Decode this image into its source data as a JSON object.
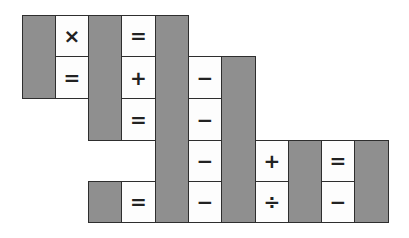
{
  "puzzle": {
    "type": "math-crossword-grid",
    "colors": {
      "blocked": "#8f8f8f",
      "open": "#fdfdfd",
      "border": "#2e2e2e",
      "symbol": "#222222"
    },
    "columns_x": [
      22,
      55,
      88,
      121,
      155,
      188,
      221,
      255,
      288,
      321,
      354,
      388
    ],
    "rows_y": [
      15,
      56,
      98,
      140,
      181,
      222
    ],
    "cells": [
      {
        "id": "b0",
        "col": 0,
        "row": 0,
        "cspan": 1,
        "rspan": 2,
        "blocked": true,
        "symbol": ""
      },
      {
        "id": "s1",
        "col": 1,
        "row": 0,
        "cspan": 1,
        "rspan": 1,
        "blocked": false,
        "symbol": "×"
      },
      {
        "id": "s2",
        "col": 1,
        "row": 1,
        "cspan": 1,
        "rspan": 1,
        "blocked": false,
        "symbol": "="
      },
      {
        "id": "b1",
        "col": 2,
        "row": 0,
        "cspan": 1,
        "rspan": 3,
        "blocked": true,
        "symbol": ""
      },
      {
        "id": "s3",
        "col": 3,
        "row": 0,
        "cspan": 1,
        "rspan": 1,
        "blocked": false,
        "symbol": "="
      },
      {
        "id": "s4",
        "col": 3,
        "row": 1,
        "cspan": 1,
        "rspan": 1,
        "blocked": false,
        "symbol": "+"
      },
      {
        "id": "s5",
        "col": 3,
        "row": 2,
        "cspan": 1,
        "rspan": 1,
        "blocked": false,
        "symbol": "="
      },
      {
        "id": "b2",
        "col": 4,
        "row": 0,
        "cspan": 1,
        "rspan": 5,
        "blocked": true,
        "symbol": ""
      },
      {
        "id": "s6",
        "col": 5,
        "row": 1,
        "cspan": 1,
        "rspan": 1,
        "blocked": false,
        "symbol": "−"
      },
      {
        "id": "s7",
        "col": 5,
        "row": 2,
        "cspan": 1,
        "rspan": 1,
        "blocked": false,
        "symbol": "−"
      },
      {
        "id": "s8",
        "col": 5,
        "row": 3,
        "cspan": 1,
        "rspan": 1,
        "blocked": false,
        "symbol": "−"
      },
      {
        "id": "s9",
        "col": 5,
        "row": 4,
        "cspan": 1,
        "rspan": 1,
        "blocked": false,
        "symbol": "−"
      },
      {
        "id": "b3",
        "col": 6,
        "row": 1,
        "cspan": 1,
        "rspan": 4,
        "blocked": true,
        "symbol": ""
      },
      {
        "id": "s10",
        "col": 7,
        "row": 3,
        "cspan": 1,
        "rspan": 1,
        "blocked": false,
        "symbol": "+"
      },
      {
        "id": "s11",
        "col": 7,
        "row": 4,
        "cspan": 1,
        "rspan": 1,
        "blocked": false,
        "symbol": "÷"
      },
      {
        "id": "b4",
        "col": 8,
        "row": 3,
        "cspan": 1,
        "rspan": 2,
        "blocked": true,
        "symbol": ""
      },
      {
        "id": "s12",
        "col": 9,
        "row": 3,
        "cspan": 1,
        "rspan": 1,
        "blocked": false,
        "symbol": "="
      },
      {
        "id": "s13",
        "col": 9,
        "row": 4,
        "cspan": 1,
        "rspan": 1,
        "blocked": false,
        "symbol": "−"
      },
      {
        "id": "b5",
        "col": 10,
        "row": 3,
        "cspan": 1,
        "rspan": 2,
        "blocked": true,
        "symbol": ""
      },
      {
        "id": "b6",
        "col": 2,
        "row": 4,
        "cspan": 1,
        "rspan": 1,
        "blocked": true,
        "symbol": ""
      },
      {
        "id": "s14",
        "col": 3,
        "row": 4,
        "cspan": 1,
        "rspan": 1,
        "blocked": false,
        "symbol": "="
      }
    ]
  }
}
